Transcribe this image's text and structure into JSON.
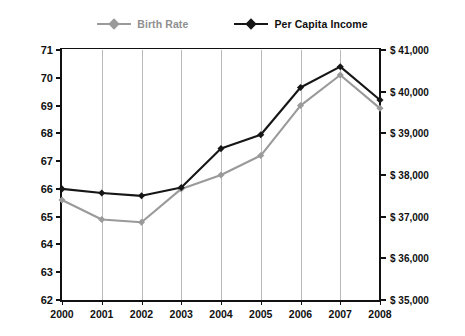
{
  "legend": {
    "position": "top-center",
    "entries": [
      {
        "label": "Birth Rate",
        "color": "#9a9a9a",
        "marker": "diamond"
      },
      {
        "label": "Per Capita Income",
        "color": "#161616",
        "marker": "diamond"
      }
    ]
  },
  "axes": {
    "y_left_title": "Birth Rate",
    "y_right_title": "Per Capita Income (in 2008 $)",
    "y_left_ticks": [
      "62",
      "63",
      "64",
      "65",
      "66",
      "67",
      "68",
      "69",
      "70",
      "71"
    ],
    "y_right_ticks": [
      "$ 35,000",
      "$ 36,000",
      "$ 37,000",
      "$ 38,000",
      "$ 39,000",
      "$ 40,000",
      "$ 41,000"
    ],
    "x_ticks": [
      "2000",
      "2001",
      "2002",
      "2003",
      "2004",
      "2005",
      "2006",
      "2007",
      "2008"
    ]
  },
  "chart_data": {
    "type": "line",
    "title": "",
    "xlabel": "",
    "ylabel": "Birth Rate",
    "y2label": "Per Capita Income (in 2008 $)",
    "grid": true,
    "legend_position": "top-center",
    "categories": [
      "2000",
      "2001",
      "2002",
      "2003",
      "2004",
      "2005",
      "2006",
      "2007",
      "2008"
    ],
    "ylim": [
      62,
      71
    ],
    "y2lim": [
      35000,
      41000
    ],
    "series": [
      {
        "name": "Birth Rate",
        "axis": "left",
        "color": "#9a9a9a",
        "values": [
          65.6,
          64.9,
          64.8,
          66.0,
          66.5,
          67.2,
          69.0,
          70.1,
          68.9
        ]
      },
      {
        "name": "Per Capita Income",
        "axis": "right",
        "color": "#161616",
        "values": [
          37980,
          37890,
          37830,
          38030,
          38980,
          39320,
          40480,
          40950,
          40080
        ],
        "values_on_left_scale": [
          66.0,
          65.85,
          65.75,
          66.05,
          67.45,
          67.95,
          69.65,
          70.4,
          69.2
        ]
      }
    ]
  }
}
